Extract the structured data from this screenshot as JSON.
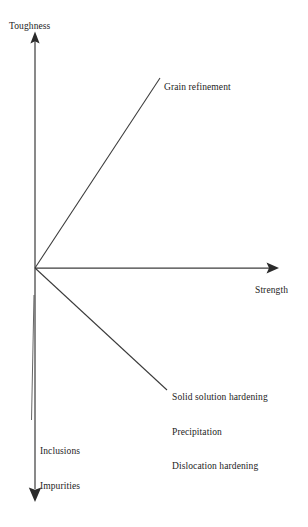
{
  "diagram": {
    "type": "schematic-axis-diagram",
    "title_visible": false,
    "colors": {
      "line": "#2b2b2b",
      "text": "#1c1c1c",
      "background": "#ffffff"
    },
    "axes": {
      "vertical": {
        "label": "Toughness",
        "direction": "up-and-down",
        "arrow_up": true,
        "arrow_down": true
      },
      "horizontal": {
        "label": "Strength",
        "direction": "right",
        "arrow_right": true
      }
    },
    "vectors": [
      {
        "name": "grain-refinement",
        "label": "Grain refinement",
        "direction": "up-right",
        "meaning": "increases both strength and toughness"
      },
      {
        "name": "strengthening-mechanisms",
        "label_lines": [
          "Solid solution hardening",
          "Precipitation",
          "Dislocation hardening"
        ],
        "direction": "down-right",
        "meaning": "increases strength but decreases toughness"
      },
      {
        "name": "defects",
        "label_lines": [
          "Inclusions",
          "Impurities"
        ],
        "direction": "down",
        "meaning": "decreases toughness with no strength gain"
      }
    ]
  }
}
